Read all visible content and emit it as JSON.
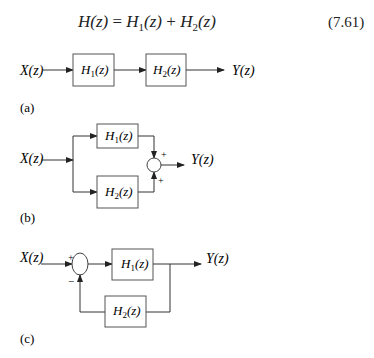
{
  "equation": {
    "text": "H(z) = H1(z) + H2(z)",
    "lhs": "H(z)",
    "eq": "=",
    "t1_base": "H",
    "t1_sub": "1",
    "t1_arg": "(z)",
    "plus": "+",
    "t2_base": "H",
    "t2_sub": "2",
    "t2_arg": "(z)",
    "number": "(7.61)"
  },
  "diagrams": {
    "a": {
      "label": "(a)",
      "input": "X(z)",
      "output": "Y(z)",
      "block1": {
        "base": "H",
        "sub": "1",
        "arg": "(z)"
      },
      "block2": {
        "base": "H",
        "sub": "2",
        "arg": "(z)"
      },
      "connection": "cascade"
    },
    "b": {
      "label": "(b)",
      "input": "X(z)",
      "output": "Y(z)",
      "block1": {
        "base": "H",
        "sub": "1",
        "arg": "(z)"
      },
      "block2": {
        "base": "H",
        "sub": "2",
        "arg": "(z)"
      },
      "sum_sign_top": "+",
      "sum_sign_bottom": "+",
      "connection": "parallel"
    },
    "c": {
      "label": "(c)",
      "input": "X(z)",
      "output": "Y(z)",
      "block1": {
        "base": "H",
        "sub": "1",
        "arg": "(z)"
      },
      "block2": {
        "base": "H",
        "sub": "2",
        "arg": "(z)"
      },
      "sum_sign_input": "+",
      "sum_sign_feedback": "−",
      "connection": "negative-feedback"
    }
  },
  "colors": {
    "line": "#333333",
    "block_border": "#555555",
    "background": "#ffffff"
  }
}
